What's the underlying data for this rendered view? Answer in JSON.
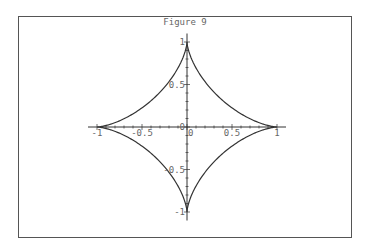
{
  "figure": {
    "title": "Figure 9"
  },
  "chart_data": {
    "type": "line",
    "title": "Figure 9",
    "xlabel": "",
    "ylabel": "",
    "xlim": [
      -1,
      1
    ],
    "ylim": [
      -1,
      1
    ],
    "x_ticks": [
      "-1",
      "-0.5",
      "0",
      "0.5",
      "1"
    ],
    "y_ticks": [
      "1",
      "0.5",
      "0",
      "-0.5",
      "-1"
    ],
    "grid": false,
    "legend": null,
    "series": [
      {
        "name": "astroid",
        "points": [
          [
            1,
            0
          ],
          [
            0.65,
            0.05
          ],
          [
            0.35,
            0.2
          ],
          [
            0.125,
            0.42
          ],
          [
            0,
            1
          ],
          [
            -0.125,
            0.42
          ],
          [
            -0.35,
            0.2
          ],
          [
            -0.65,
            0.05
          ],
          [
            -1,
            0
          ],
          [
            -0.65,
            -0.05
          ],
          [
            -0.35,
            -0.2
          ],
          [
            -0.125,
            -0.42
          ],
          [
            0,
            -1
          ],
          [
            0.125,
            -0.42
          ],
          [
            0.35,
            -0.2
          ],
          [
            0.65,
            -0.05
          ],
          [
            1,
            0
          ]
        ]
      }
    ],
    "colors": {
      "curve": "#333333",
      "axes": "#333333",
      "labels": "#666666",
      "frame": "#555555"
    }
  }
}
